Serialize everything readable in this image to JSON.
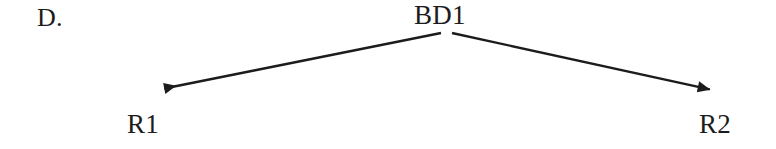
{
  "figure": {
    "panel_label": "D.",
    "background_color": "#ffffff",
    "ink_color": "#1c1c1c",
    "width": 776,
    "height": 149
  },
  "chart_data": {
    "type": "diagram",
    "diagram_kind": "bifurcation-tree",
    "title": "D.",
    "nodes": [
      {
        "id": "BD1",
        "label": "BD1",
        "role": "root",
        "x": 447,
        "y": 16
      },
      {
        "id": "R1",
        "label": "R1",
        "role": "leaf-left",
        "x": 151,
        "y": 127
      },
      {
        "id": "R2",
        "label": "R2",
        "role": "leaf-right",
        "x": 723,
        "y": 127
      }
    ],
    "edges": [
      {
        "from": "BD1",
        "to": "R1",
        "direction": "from-root-to-leaf",
        "arrowhead": "solid-triangle",
        "arrowhead_at": "to",
        "start": {
          "x": 441,
          "y": 33
        },
        "end": {
          "x": 152,
          "y": 91
        }
      },
      {
        "from": "BD1",
        "to": "R2",
        "direction": "from-root-to-leaf",
        "arrowhead": "solid-triangle",
        "arrowhead_at": "to",
        "start": {
          "x": 452,
          "y": 33
        },
        "end": {
          "x": 722,
          "y": 92
        }
      }
    ],
    "line_width": 2.4,
    "legend": [],
    "annotations": []
  }
}
